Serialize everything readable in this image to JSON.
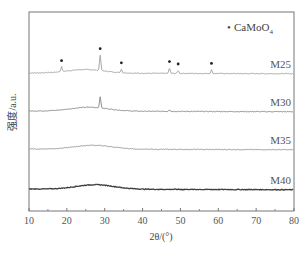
{
  "chart_data": {
    "type": "line",
    "title": "",
    "xlabel": "2θ/(°)",
    "ylabel": "强度/a.u.",
    "xlim": [
      10,
      80
    ],
    "xticks": [
      10,
      20,
      30,
      40,
      50,
      60,
      70,
      80
    ],
    "xticks_minor": [
      15,
      25,
      35,
      45,
      55,
      65,
      75
    ],
    "yticks": [],
    "grid": false,
    "legend": {
      "position": "upper right",
      "entries": [
        {
          "marker": "•",
          "label": "CaMoO4"
        }
      ]
    },
    "series": [
      {
        "name": "M25",
        "offset_px": 73,
        "color": "#a8a8a8",
        "hump_center": 25,
        "hump_height": 0.6,
        "peaks": [
          {
            "x": 18.6,
            "h": 0.8
          },
          {
            "x": 28.8,
            "h": 2.6
          },
          {
            "x": 34.4,
            "h": 0.6
          },
          {
            "x": 47.1,
            "h": 0.9
          },
          {
            "x": 49.4,
            "h": 0.5
          },
          {
            "x": 58.2,
            "h": 0.6
          }
        ],
        "peak_markers": [
          18.6,
          28.8,
          34.4,
          47.1,
          49.4,
          58.2
        ]
      },
      {
        "name": "M30",
        "offset_px": 111,
        "color": "#8e8e8e",
        "hump_center": 26,
        "hump_height": 0.65,
        "peaks": [
          {
            "x": 28.8,
            "h": 1.9
          },
          {
            "x": 47.1,
            "h": 0.3
          }
        ],
        "peak_markers": []
      },
      {
        "name": "M35",
        "offset_px": 149,
        "color": "#9c9c9c",
        "hump_center": 27,
        "hump_height": 0.65,
        "peaks": [],
        "peak_markers": []
      },
      {
        "name": "M40",
        "offset_px": 189,
        "color": "#3e3e3e",
        "hump_center": 27.5,
        "hump_height": 0.75,
        "peaks": [],
        "peak_markers": []
      }
    ],
    "annotations": [
      {
        "text": "M25",
        "x": 76,
        "series": "M25"
      },
      {
        "text": "M30",
        "x": 76,
        "series": "M30"
      },
      {
        "text": "M35",
        "x": 76,
        "series": "M35"
      },
      {
        "text": "M40",
        "x": 76,
        "series": "M40"
      }
    ]
  },
  "labels": {
    "x_axis_title": "2θ/(°)",
    "y_axis_title": "强度/a.u.",
    "legend_marker": "•",
    "legend_label": "CaMoO",
    "legend_subscript": "4"
  }
}
